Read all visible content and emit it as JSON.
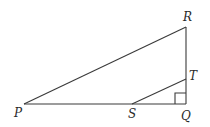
{
  "diagram": {
    "type": "geometry-triangle",
    "stroke_color": "#3a3a3a",
    "points": {
      "P": {
        "label": "P",
        "x": 24,
        "y": 104
      },
      "Q": {
        "label": "Q",
        "x": 186,
        "y": 104
      },
      "R": {
        "label": "R",
        "x": 186,
        "y": 27
      },
      "S": {
        "label": "S",
        "x": 132,
        "y": 104
      },
      "T": {
        "label": "T",
        "x": 186,
        "y": 79
      }
    },
    "segments": [
      "PR",
      "RQ",
      "PQ",
      "ST"
    ],
    "right_angle_at": "Q"
  }
}
